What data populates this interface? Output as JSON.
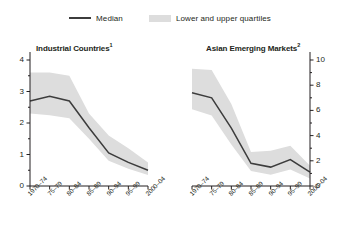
{
  "legend": {
    "median_label": "Median",
    "band_label": "Lower and upper quartiles",
    "line_color": "#3c3c3c",
    "band_color": "#dddddd"
  },
  "chart_data": [
    {
      "type": "line",
      "title": "Industrial Countries",
      "title_superscript": "1",
      "panel": "left",
      "xlabel": "",
      "ylabel": "",
      "ylim": [
        0,
        4
      ],
      "yticks": [
        0,
        1,
        2,
        3,
        4
      ],
      "ytick_labels": [
        "0",
        "1",
        "2",
        "3",
        "4"
      ],
      "yminor": [
        0.5,
        1.5,
        2.5,
        3.5
      ],
      "y_axis_side": "left",
      "grid": false,
      "legend_position": "top-center",
      "categories": [
        "1970–74",
        "75–79",
        "80–84",
        "85–89",
        "90–94",
        "95–99",
        "2000–04"
      ],
      "series": [
        {
          "name": "Median",
          "values": [
            2.7,
            2.85,
            2.7,
            1.85,
            1.05,
            0.75,
            0.5
          ]
        },
        {
          "name": "Upper quartile",
          "values": [
            3.6,
            3.6,
            3.5,
            2.3,
            1.6,
            1.2,
            0.75
          ]
        },
        {
          "name": "Lower quartile",
          "values": [
            2.3,
            2.25,
            2.15,
            1.5,
            0.8,
            0.55,
            0.35
          ]
        }
      ]
    },
    {
      "type": "line",
      "title": "Asian Emerging Markets",
      "title_superscript": "2",
      "panel": "right",
      "xlabel": "",
      "ylabel": "",
      "ylim": [
        0,
        10
      ],
      "yticks": [
        0,
        2,
        4,
        6,
        8,
        10
      ],
      "ytick_labels": [
        "0",
        "2",
        "4",
        "6",
        "8",
        "10"
      ],
      "yminor": [
        1,
        3,
        5,
        7,
        9
      ],
      "y_axis_side": "right",
      "grid": false,
      "legend_position": "top-center",
      "categories": [
        "1970–74",
        "75–79",
        "80–84",
        "85–89",
        "90–94",
        "95–99",
        "2000–04"
      ],
      "series": [
        {
          "name": "Median",
          "values": [
            7.4,
            7.0,
            4.6,
            1.8,
            1.5,
            2.1,
            1.1
          ]
        },
        {
          "name": "Upper quartile",
          "values": [
            9.3,
            9.2,
            6.5,
            2.7,
            2.8,
            3.2,
            1.6
          ]
        },
        {
          "name": "Lower quartile",
          "values": [
            6.1,
            5.6,
            3.3,
            1.2,
            0.9,
            1.3,
            0.6
          ]
        }
      ]
    }
  ]
}
